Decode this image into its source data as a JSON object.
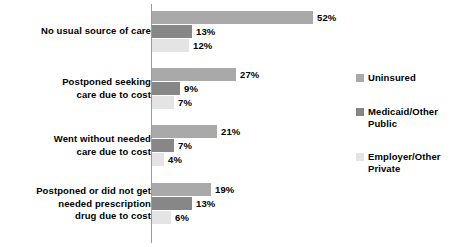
{
  "chart_data": {
    "type": "bar",
    "orientation": "horizontal",
    "title": "",
    "subtitle": "",
    "xlabel": "",
    "ylabel": "",
    "grid": false,
    "axis_visible": true,
    "xlim": [
      0,
      60
    ],
    "legend_position": "right",
    "value_suffix": "%",
    "categories": [
      "No usual source of care",
      "Postponed seeking\ncare due to cost",
      "Went without needed\ncare due to cost",
      "Postponed or did not get\nneeded prescription\ndrug due to cost"
    ],
    "series": [
      {
        "name": "Uninsured",
        "color": "#a9a9a9",
        "values": [
          52,
          27,
          21,
          19
        ],
        "labels": [
          "52%",
          "27%",
          "21%",
          "19%"
        ]
      },
      {
        "name": "Medicaid/Other\nPublic",
        "color": "#878787",
        "values": [
          13,
          9,
          7,
          13
        ],
        "labels": [
          "13%",
          "9%",
          "7%",
          "13%"
        ]
      },
      {
        "name": "Employer/Other\nPrivate",
        "color": "#e4e4e4",
        "values": [
          12,
          7,
          4,
          6
        ],
        "labels": [
          "12%",
          "7%",
          "4%",
          "6%"
        ]
      }
    ]
  },
  "legend": {
    "items": [
      {
        "label": "Uninsured",
        "color": "#a9a9a9"
      },
      {
        "label": "Medicaid/Other\nPublic",
        "color": "#878787"
      },
      {
        "label": "Employer/Other\nPrivate",
        "color": "#e4e4e4"
      }
    ]
  },
  "groups": [
    {
      "category": "No usual source of care",
      "top": 11,
      "label_top": 25,
      "rows": [
        {
          "series": "Uninsured",
          "value": 52,
          "label": "52%",
          "color": "#a9a9a9"
        },
        {
          "series": "Medicaid/Other Public",
          "value": 13,
          "label": "13%",
          "color": "#878787"
        },
        {
          "series": "Employer/Other Private",
          "value": 12,
          "label": "12%",
          "color": "#e4e4e4"
        }
      ]
    },
    {
      "category": "Postponed seeking\ncare due to cost",
      "top": 68,
      "label_top": 76,
      "rows": [
        {
          "series": "Uninsured",
          "value": 27,
          "label": "27%",
          "color": "#a9a9a9"
        },
        {
          "series": "Medicaid/Other Public",
          "value": 9,
          "label": "9%",
          "color": "#878787"
        },
        {
          "series": "Employer/Other Private",
          "value": 7,
          "label": "7%",
          "color": "#e4e4e4"
        }
      ]
    },
    {
      "category": "Went without needed\ncare due to cost",
      "top": 125,
      "label_top": 133,
      "rows": [
        {
          "series": "Uninsured",
          "value": 21,
          "label": "21%",
          "color": "#a9a9a9"
        },
        {
          "series": "Medicaid/Other Public",
          "value": 7,
          "label": "7%",
          "color": "#878787"
        },
        {
          "series": "Employer/Other Private",
          "value": 4,
          "label": "4%",
          "color": "#e4e4e4"
        }
      ]
    },
    {
      "category": "Postponed or did not get\nneeded prescription\ndrug due to cost",
      "top": 183,
      "label_top": 185,
      "rows": [
        {
          "series": "Uninsured",
          "value": 19,
          "label": "19%",
          "color": "#a9a9a9"
        },
        {
          "series": "Medicaid/Other Public",
          "value": 13,
          "label": "13%",
          "color": "#878787"
        },
        {
          "series": "Employer/Other Private",
          "value": 6,
          "label": "6%",
          "color": "#e4e4e4"
        }
      ]
    }
  ],
  "scale": {
    "px_per_percent": 3.1
  }
}
